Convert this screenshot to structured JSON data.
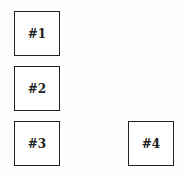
{
  "diagram": {
    "boxes": [
      {
        "label": "#1"
      },
      {
        "label": "#2"
      },
      {
        "label": "#3"
      },
      {
        "label": "#4"
      }
    ]
  }
}
